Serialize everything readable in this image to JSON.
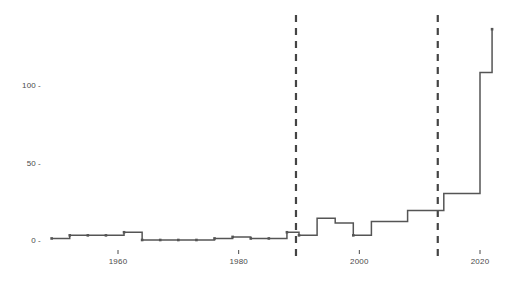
{
  "chart_data": {
    "type": "line",
    "variant": "step-post",
    "title": "",
    "subtitle": "",
    "xlabel": "",
    "ylabel": "",
    "xlim": [
      1947,
      2024
    ],
    "ylim": [
      -6,
      145
    ],
    "grid": false,
    "legend": null,
    "line_color": "#555555",
    "marker_color": "#555555",
    "reference_line_color": "#444444",
    "background_color": "#ffffff",
    "x_ticks": [
      1960,
      1980,
      2000,
      2020
    ],
    "x_tick_labels": [
      "1960",
      "1980",
      "2000",
      "2020"
    ],
    "y_ticks": [
      0,
      50,
      100
    ],
    "y_tick_labels": [
      "0",
      "50",
      "100"
    ],
    "reference_lines": [
      {
        "x": 1989.5,
        "style": "dashed",
        "label": ""
      },
      {
        "x": 2013.0,
        "style": "dashed",
        "label": ""
      }
    ],
    "x": [
      1949,
      1952,
      1955,
      1958,
      1961,
      1964,
      1967,
      1970,
      1973,
      1976,
      1979,
      1982,
      1985,
      1988,
      1990,
      1993,
      1996,
      1999,
      2002,
      2005,
      2008,
      2011,
      2014,
      2017,
      2020,
      2022
    ],
    "values": [
      1,
      3,
      3,
      3,
      5,
      0,
      0,
      0,
      0,
      1,
      2,
      1,
      1,
      5,
      3,
      14,
      11,
      3,
      12,
      12,
      19,
      19,
      30,
      30,
      108,
      136
    ],
    "series": [
      {
        "name": "count",
        "points": [
          {
            "x": 1949,
            "y": 1
          },
          {
            "x": 1952,
            "y": 3
          },
          {
            "x": 1955,
            "y": 3
          },
          {
            "x": 1958,
            "y": 3
          },
          {
            "x": 1961,
            "y": 5
          },
          {
            "x": 1964,
            "y": 0
          },
          {
            "x": 1967,
            "y": 0
          },
          {
            "x": 1970,
            "y": 0
          },
          {
            "x": 1973,
            "y": 0
          },
          {
            "x": 1976,
            "y": 1
          },
          {
            "x": 1979,
            "y": 2
          },
          {
            "x": 1982,
            "y": 1
          },
          {
            "x": 1985,
            "y": 1
          },
          {
            "x": 1988,
            "y": 5
          },
          {
            "x": 1990,
            "y": 3
          },
          {
            "x": 1993,
            "y": 14
          },
          {
            "x": 1996,
            "y": 11
          },
          {
            "x": 1999,
            "y": 3
          },
          {
            "x": 2002,
            "y": 12
          },
          {
            "x": 2005,
            "y": 12
          },
          {
            "x": 2008,
            "y": 19
          },
          {
            "x": 2011,
            "y": 19
          },
          {
            "x": 2014,
            "y": 30
          },
          {
            "x": 2017,
            "y": 30
          },
          {
            "x": 2020,
            "y": 108
          },
          {
            "x": 2022,
            "y": 136
          }
        ]
      }
    ]
  },
  "axes": {
    "y_tick_mark": "-",
    "y_labels": [
      "100",
      "50",
      "0"
    ],
    "x_labels": [
      "1960",
      "1980",
      "2000",
      "2020"
    ]
  }
}
